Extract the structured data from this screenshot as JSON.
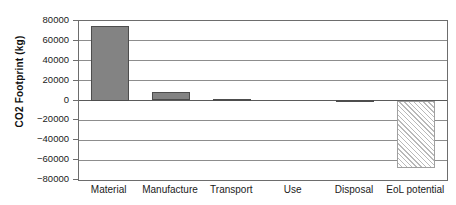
{
  "chart_data": {
    "type": "bar",
    "title": "",
    "xlabel": "",
    "ylabel": "CO2 Footprint (kg)",
    "ylim": [
      -80000,
      80000
    ],
    "ytick_labels": [
      "80000",
      "60000",
      "40000",
      "20000",
      "0",
      "−20000",
      "−40000",
      "−60000",
      "−80000"
    ],
    "ytick_values": [
      80000,
      60000,
      40000,
      20000,
      0,
      -20000,
      -40000,
      -60000,
      -80000
    ],
    "grid": true,
    "legend": "none",
    "categories": [
      "Material",
      "Manufacture",
      "Transport",
      "Use",
      "Disposal",
      "EoL potential"
    ],
    "values": [
      75000,
      9000,
      2000,
      0,
      500,
      -68000
    ],
    "bar_styles": [
      "solid",
      "solid",
      "solid",
      "solid",
      "solid",
      "hatched"
    ],
    "colors": {
      "bar_fill": "#838383",
      "bar_edge": "#4d4d4d",
      "hatch_fill": "#ffffff",
      "hatch_line": "#b9b9b9",
      "gridline": "#8d8d8d",
      "frame": "#6d6d6d",
      "text": "#1a1a1a"
    }
  }
}
